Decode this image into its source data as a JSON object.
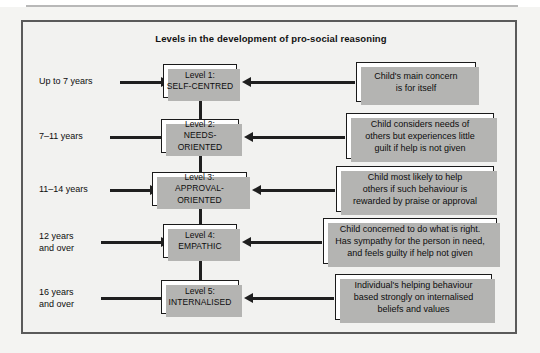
{
  "figure": {
    "title": "Levels in the development of pro-social reasoning"
  },
  "levels": [
    {
      "number": "Level 1:",
      "name": "SELF-CENTRED",
      "age": "Up to 7 years",
      "description": "Child's main concern\nis for itself"
    },
    {
      "number": "Level 2:",
      "name": "NEEDS-ORIENTED",
      "age": "7–11 years",
      "description": "Child considers needs  of\nothers but experiences little\nguilt if help is not given"
    },
    {
      "number": "Level 3:",
      "name": "APPROVAL-ORIENTED",
      "age": "11–14 years",
      "description": "Child most likely to help\nothers if such behaviour is\nrewarded by praise or approval"
    },
    {
      "number": "Level 4:",
      "name": "EMPATHIC",
      "age": "12 years\nand over",
      "description": "Child concerned to do what is right.\nHas sympathy for the person in need,\nand feels guilty if help not given"
    },
    {
      "number": "Level 5:",
      "name": "INTERNALISED",
      "age": "16 years\nand over",
      "description": "Individual's helping behaviour\nbased strongly on internalised\nbeliefs and values"
    }
  ],
  "colors": {
    "frame_border": "#5a5a5a",
    "frame_background": "#f2f2f0",
    "box_border": "#1a1a1a",
    "box_background": "#ffffff",
    "box_shadow": "#b4b4b2",
    "arrow": "#1f1f1f",
    "text": "#0d0d0d"
  }
}
